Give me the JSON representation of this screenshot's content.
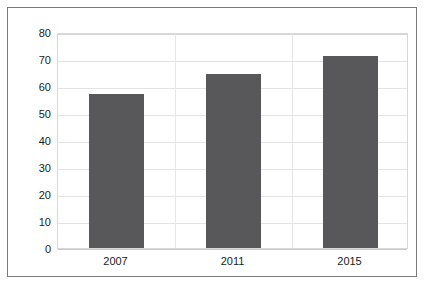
{
  "chart_data": {
    "type": "bar",
    "title": "",
    "subtitle": "",
    "xlabel": "",
    "ylabel": "",
    "categories": [
      "2007",
      "2011",
      "2015"
    ],
    "values": [
      57,
      64.5,
      71
    ],
    "series": [
      {
        "name": "",
        "values": [
          57,
          64.5,
          71
        ],
        "color": "#58585a"
      }
    ],
    "ylim": [
      0,
      80
    ],
    "yticks": [
      0,
      10,
      20,
      30,
      40,
      50,
      60,
      70,
      80
    ],
    "ytick_labels": [
      "0",
      "10",
      "20",
      "30",
      "40",
      "50",
      "60",
      "70",
      "80"
    ],
    "grid": true,
    "grid_axis": "both",
    "legend": false,
    "legend_position": "none",
    "bar_color": "#58585a",
    "plot_background": "#ffffff",
    "frame_color": "#7a7a7a",
    "gridline_color": "#e3e3e3",
    "data_labels": false
  }
}
